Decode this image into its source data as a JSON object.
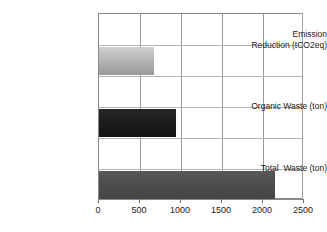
{
  "chart_data": {
    "type": "bar",
    "orientation": "horizontal",
    "title": "",
    "xlabel": "",
    "ylabel": "",
    "categories": [
      "Emission\nReduction (tCO2eq)",
      "Organic Waste (ton)",
      "Total  Waste (ton)"
    ],
    "values": [
      670,
      940,
      2150
    ],
    "series": [
      {
        "name": "",
        "values": [
          670,
          940,
          2150
        ]
      }
    ],
    "xlim": [
      0,
      2500
    ],
    "xticks": [
      0,
      500,
      1000,
      1500,
      2000,
      2500
    ],
    "xticklabels": [
      "0",
      "500",
      "1000",
      "1500",
      "2000",
      "2500"
    ],
    "grid": true,
    "legend": false,
    "bar_colors": [
      "#b5b5b5",
      "#1a1a1a",
      "#4c4c4c"
    ],
    "background_color": "#ffffff",
    "grid_color": "#9b9b9b",
    "axis_color": "#8a8a8a"
  }
}
